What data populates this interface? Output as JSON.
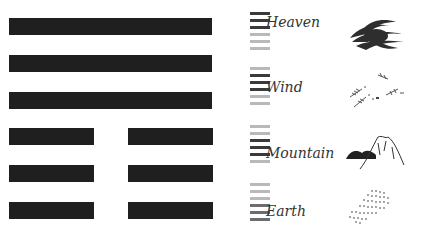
{
  "hexagram": {
    "lines": [
      "solid",
      "solid",
      "solid",
      "broken",
      "broken",
      "broken"
    ]
  },
  "trigrams": [
    {
      "label": "Heaven",
      "highlight": [
        0,
        1,
        2
      ],
      "tone": "dark",
      "image": "swirling-cloud-icon"
    },
    {
      "label": "Wind",
      "highlight": [
        1,
        2,
        3
      ],
      "tone": "dark",
      "image": "windblown-leaves-icon"
    },
    {
      "label": "Mountain",
      "highlight": [
        2,
        3,
        4
      ],
      "tone": "dark",
      "image": "mountain-icon"
    },
    {
      "label": "Earth",
      "highlight": [
        3,
        4,
        5
      ],
      "tone": "mid",
      "image": "earth-field-icon"
    }
  ]
}
